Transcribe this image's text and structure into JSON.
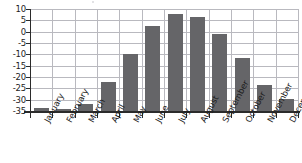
{
  "chart_data": {
    "type": "bar",
    "title": "",
    "xlabel": "",
    "ylabel": "",
    "categories": [
      "January",
      "February",
      "March",
      "April",
      "May",
      "June",
      "July",
      "August",
      "September",
      "October",
      "November",
      "December"
    ],
    "values": [
      -33.5,
      -34.2,
      -32.0,
      -22.0,
      -10.0,
      2.5,
      8.0,
      6.3,
      -1.0,
      -11.5,
      -23.5,
      -29.5
    ],
    "ylim": [
      -35,
      10
    ],
    "yticks": [
      10,
      5,
      0,
      -5,
      -10,
      -15,
      -20,
      -25,
      -30,
      -35
    ],
    "ytick_labels": [
      "10",
      "5",
      "0",
      "-5",
      "-10",
      "-15",
      "-20",
      "-25",
      "-30",
      "-35"
    ],
    "grid": true,
    "legend": false,
    "bar_color": "#656568",
    "grid_color": "#b9b9bf",
    "axis_color": "#2b2b2b"
  }
}
